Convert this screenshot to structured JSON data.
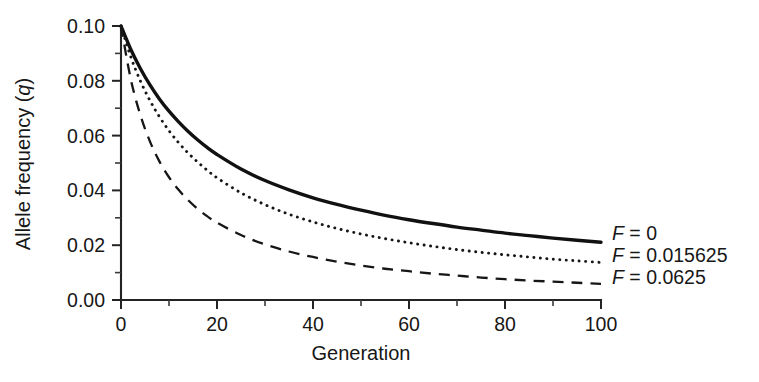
{
  "chart_data": {
    "type": "line",
    "title": "",
    "xlabel": "Generation",
    "ylabel": "Allele frequency (q)",
    "ylabel_parts": {
      "text": "Allele frequency (",
      "italic": "q",
      "tail": ")"
    },
    "xlim": [
      0,
      100
    ],
    "ylim": [
      0.0,
      0.1
    ],
    "grid": false,
    "legend_position": "right-inside",
    "x_ticks_major": [
      0,
      20,
      40,
      60,
      80,
      100
    ],
    "x_tick_labels": [
      "0",
      "20",
      "40",
      "60",
      "80",
      "100"
    ],
    "x_ticks_minor": [
      10,
      30,
      50,
      70,
      90
    ],
    "y_ticks_major": [
      0.0,
      0.02,
      0.04,
      0.06,
      0.08,
      0.1
    ],
    "y_tick_labels": [
      "0.00",
      "0.02",
      "0.04",
      "0.06",
      "0.08",
      "0.10"
    ],
    "y_ticks_minor": [
      0.01,
      0.03,
      0.05,
      0.07,
      0.09
    ],
    "x": [
      0,
      2,
      4,
      6,
      8,
      10,
      12,
      14,
      16,
      18,
      20,
      25,
      30,
      35,
      40,
      45,
      50,
      55,
      60,
      65,
      70,
      75,
      80,
      85,
      90,
      95,
      100
    ],
    "series": [
      {
        "name": "F = 0",
        "label_prefix": "F",
        "label_rest": " = 0",
        "style": "solid",
        "color": "#111111",
        "values": [
          0.1,
          0.0916,
          0.0846,
          0.0786,
          0.0734,
          0.0689,
          0.065,
          0.0615,
          0.0584,
          0.0556,
          0.0531,
          0.0478,
          0.0436,
          0.0402,
          0.0373,
          0.0349,
          0.0328,
          0.0309,
          0.0293,
          0.0279,
          0.0266,
          0.0255,
          0.0244,
          0.0235,
          0.0226,
          0.0218,
          0.0211
        ]
      },
      {
        "name": "F = 0.015625",
        "label_prefix": "F",
        "label_rest": " = 0.015625",
        "style": "dotted",
        "color": "#161616",
        "values": [
          0.1,
          0.0889,
          0.0801,
          0.0729,
          0.0669,
          0.0618,
          0.0574,
          0.0536,
          0.0503,
          0.0473,
          0.0446,
          0.0391,
          0.0348,
          0.0313,
          0.0285,
          0.0261,
          0.0241,
          0.0224,
          0.0209,
          0.0196,
          0.0184,
          0.0174,
          0.0165,
          0.0157,
          0.0149,
          0.0143,
          0.0137
        ]
      },
      {
        "name": "F = 0.0625",
        "label_prefix": "F",
        "label_rest": " = 0.0625",
        "style": "dashed",
        "color": "#161616",
        "values": [
          0.1,
          0.0809,
          0.0677,
          0.058,
          0.0506,
          0.0448,
          0.0402,
          0.0364,
          0.0332,
          0.0305,
          0.0282,
          0.0237,
          0.0203,
          0.0177,
          0.0157,
          0.014,
          0.0126,
          0.0114,
          0.0105,
          0.0096,
          0.0089,
          0.0082,
          0.0076,
          0.0071,
          0.0067,
          0.0063,
          0.0059
        ]
      }
    ],
    "legend_entries": [
      {
        "prefix": "F",
        "rest": " = 0",
        "style": "solid"
      },
      {
        "prefix": "F",
        "rest": " = 0.015625",
        "style": "dotted"
      },
      {
        "prefix": "F",
        "rest": " = 0.0625",
        "style": "dashed"
      }
    ]
  }
}
